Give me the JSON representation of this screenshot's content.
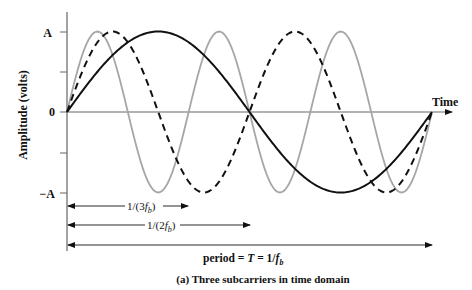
{
  "chart_data": {
    "type": "line",
    "title": "(a) Three subcarriers in time domain",
    "xlabel": "Time",
    "ylabel": "Amplitude (volts)",
    "yticks": [
      "A",
      "0",
      "−A"
    ],
    "ylim": [
      -1,
      1
    ],
    "xlim": [
      0,
      1
    ],
    "x_unit": "T",
    "series": [
      {
        "name": "subcarrier f_b",
        "style": "solid",
        "color": "#111111",
        "cycles_per_period": 1,
        "amplitude": 1
      },
      {
        "name": "subcarrier 2f_b",
        "style": "dashed",
        "color": "#111111",
        "cycles_per_period": 2,
        "amplitude": 1
      },
      {
        "name": "subcarrier 3f_b",
        "style": "solid",
        "color": "#a6a6a6",
        "cycles_per_period": 3,
        "amplitude": 1
      }
    ],
    "annotations": [
      {
        "label": "1/(3f_b)",
        "from": 0,
        "to": 0.3333
      },
      {
        "label": "1/(2f_b)",
        "from": 0,
        "to": 0.5
      },
      {
        "label": "period = T = 1/f_b",
        "from": 0,
        "to": 1
      }
    ],
    "grid": false,
    "legend": "none"
  },
  "labels": {
    "y_tick_A": "A",
    "y_tick_0": "0",
    "y_tick_negA": "−A",
    "x_axis": "Time",
    "y_axis": "Amplitude (volts)",
    "arrow1_prefix": "1/(3",
    "arrow1_var": "f",
    "arrow1_sub": "b",
    "arrow1_suffix": ")",
    "arrow2_prefix": "1/(2",
    "arrow2_var": "f",
    "arrow2_sub": "b",
    "arrow2_suffix": ")",
    "period_prefix": "period = ",
    "period_T": "T",
    "period_mid": " = 1/",
    "period_var": "f",
    "period_sub": "b",
    "caption": "(a) Three subcarriers in time domain"
  },
  "colors": {
    "ink": "#111111",
    "gray_wave": "#a6a6a6",
    "axis": "#666666"
  }
}
